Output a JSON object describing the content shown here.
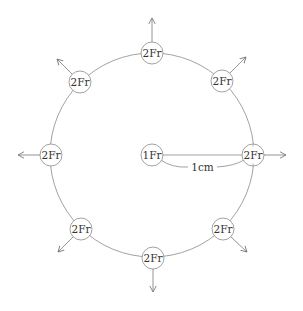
{
  "diagram": {
    "title": "",
    "center": {
      "x": 152,
      "y": 155
    },
    "ring_radius": 102,
    "node_radius": 11,
    "stroke_color": "#8a8a8a",
    "text_color": "#333333",
    "center_node": {
      "label": "1Fr"
    },
    "outer_nodes": [
      {
        "label": "2Fr",
        "angle_deg": 0,
        "arrow": "right"
      },
      {
        "label": "2Fr",
        "angle_deg": 45,
        "arrow": "up-right"
      },
      {
        "label": "2Fr",
        "angle_deg": 90,
        "arrow": "up"
      },
      {
        "label": "2Fr",
        "angle_deg": 135,
        "arrow": "up-left"
      },
      {
        "label": "2Fr",
        "angle_deg": 180,
        "arrow": "left"
      },
      {
        "label": "2Fr",
        "angle_deg": 225,
        "arrow": "down-left"
      },
      {
        "label": "2Fr",
        "angle_deg": 270,
        "arrow": "down"
      },
      {
        "label": "2Fr",
        "angle_deg": 315,
        "arrow": "down-right"
      }
    ],
    "radius_annotation": {
      "label": "1cm"
    }
  }
}
